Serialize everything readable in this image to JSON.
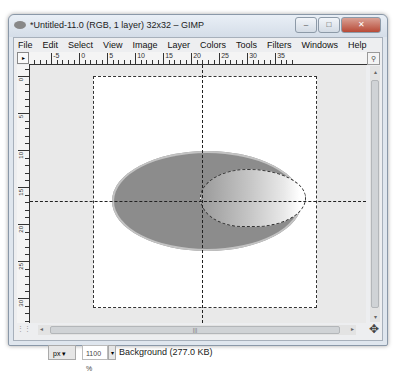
{
  "window": {
    "title": "*Untitled-11.0 (RGB, 1 layer) 32x32 – GIMP",
    "controls": {
      "minimize": "–",
      "maximize": "□",
      "close": "✕"
    }
  },
  "menubar": {
    "items": [
      {
        "label": "File",
        "accel": "F"
      },
      {
        "label": "Edit",
        "accel": "E"
      },
      {
        "label": "Select",
        "accel": "S"
      },
      {
        "label": "View",
        "accel": "V"
      },
      {
        "label": "Image",
        "accel": "I"
      },
      {
        "label": "Layer",
        "accel": "L"
      },
      {
        "label": "Colors",
        "accel": "C"
      },
      {
        "label": "Tools",
        "accel": "T"
      },
      {
        "label": "Filters",
        "accel": "r"
      },
      {
        "label": "Windows",
        "accel": "W"
      },
      {
        "label": "Help",
        "accel": "H"
      }
    ]
  },
  "rulers": {
    "horizontal_labels": [
      "-5",
      "0",
      "5",
      "10",
      "15",
      "20",
      "25",
      "30",
      "35"
    ],
    "vertical_labels": [
      "0",
      "5",
      "10",
      "15",
      "20",
      "25",
      "30"
    ]
  },
  "canvas": {
    "image_size": "32x32",
    "ellipse_color": "#8c8c8c",
    "inner_gradient": [
      "#9a9a9a",
      "#ffffff"
    ]
  },
  "statusbar": {
    "unit": "px",
    "zoom": "1100",
    "zoom_suffix": "%",
    "layer_info": "Background (277.0 KB)"
  }
}
